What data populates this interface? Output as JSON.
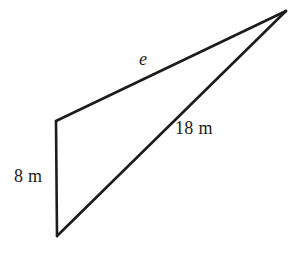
{
  "figure": {
    "kind": "geometry-triangle-diagram",
    "background_color": "#ffffff",
    "stroke_color": "#1c1c1c",
    "text_color": "#1c1c1c",
    "stroke_width": 2.6,
    "width": 288,
    "height": 258,
    "vertices": {
      "top_left": {
        "x": 56,
        "y": 121
      },
      "bottom_left": {
        "x": 57,
        "y": 236
      },
      "right_apex": {
        "x": 286,
        "y": 11
      }
    },
    "sides": [
      {
        "name": "vertical-side",
        "from": "top_left",
        "to": "bottom_left",
        "label": "8 m",
        "label_style": "upright"
      },
      {
        "name": "hypotenuse-lower",
        "from": "bottom_left",
        "to": "right_apex",
        "label": "18 m",
        "label_style": "upright"
      },
      {
        "name": "hypotenuse-upper",
        "from": "top_left",
        "to": "right_apex",
        "label": "e",
        "label_style": "italic"
      }
    ],
    "labels": {
      "side_8m": "8 m",
      "side_18m": "18 m",
      "side_e": "e"
    }
  }
}
